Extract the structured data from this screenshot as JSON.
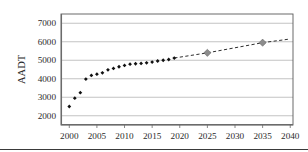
{
  "chart_data": {
    "type": "scatter",
    "title": "",
    "xlabel": "",
    "ylabel": "AADT",
    "xlim": [
      1998.5,
      2040.5
    ],
    "ylim": [
      1500,
      7500
    ],
    "grid": true,
    "legend": "none",
    "x_ticks": [
      2000,
      2005,
      2010,
      2015,
      2020,
      2025,
      2030,
      2035,
      2040
    ],
    "x_tick_labels": [
      "2000",
      "2005",
      "2010",
      "2015",
      "2020",
      "2025",
      "2030",
      "2035",
      "2040"
    ],
    "y_ticks": [
      2000,
      3000,
      4000,
      5000,
      6000,
      7000
    ],
    "y_tick_labels": [
      "2000",
      "3000",
      "4000",
      "5000",
      "6000",
      "7000"
    ],
    "series": [
      {
        "name": "Historical AADT",
        "style": "markers",
        "marker": "diamond",
        "color": "#111111",
        "x": [
          2000,
          2001,
          2002,
          2003,
          2004,
          2005,
          2006,
          2007,
          2008,
          2009,
          2010,
          2011,
          2012,
          2013,
          2014,
          2015,
          2016,
          2017,
          2018,
          2019
        ],
        "values": [
          2500,
          2950,
          3250,
          3980,
          4180,
          4250,
          4320,
          4480,
          4560,
          4650,
          4720,
          4790,
          4810,
          4830,
          4860,
          4900,
          4960,
          5000,
          5040,
          5120
        ]
      },
      {
        "name": "Forecast AADT",
        "style": "dashed-line-with-markers",
        "marker": "diamond",
        "color": "#8c8c8c",
        "line_color": "#2e2e2e",
        "x": [
          2019,
          2025,
          2035,
          2040
        ],
        "values": [
          5120,
          5400,
          5950,
          6150
        ],
        "marker_x": [
          2025,
          2035
        ],
        "marker_values": [
          5400,
          5950
        ]
      }
    ]
  },
  "axis": {
    "y_title": "AADT"
  }
}
